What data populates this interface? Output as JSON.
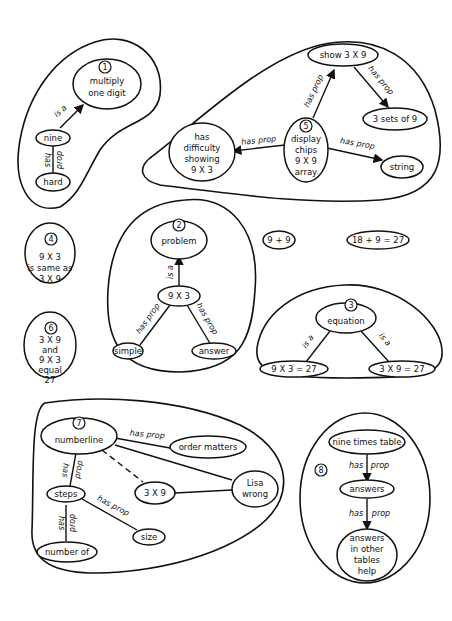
{
  "clusters": {
    "c1": {
      "number": "1",
      "nodes": {
        "root": [
          "multiply",
          "one digit"
        ],
        "nine": "nine",
        "hard": "hard"
      },
      "relations": {
        "nine_root": "is a",
        "nine_hard_a": "has",
        "nine_hard_b": "prop"
      }
    },
    "c2": {
      "number": "2",
      "nodes": {
        "root": "problem",
        "center": "9 X 3",
        "simple": "simple",
        "answer": "answer"
      },
      "relations": {
        "center_root": "is a",
        "center_simple": "has prop",
        "center_answer": "has prop"
      }
    },
    "c3": {
      "number": "3",
      "nodes": {
        "root": "equation",
        "left": "9 X 3 = 27",
        "right": "3 X 9 = 27"
      },
      "relations": {
        "root_left": "is a",
        "root_right": "is a"
      }
    },
    "c4": {
      "number": "4",
      "lines": [
        "9 X 3",
        "is same as",
        "3 X 9"
      ]
    },
    "c5": {
      "number": "5",
      "nodes": {
        "center": [
          "display",
          "chips",
          "9 X 9",
          "array"
        ],
        "show": "show 3 X 9",
        "sets": "3 sets of 9",
        "difficulty": [
          "has",
          "difficulty",
          "showing",
          "9 X 3"
        ],
        "string": "string"
      },
      "relations": {
        "center_show": "has prop",
        "show_sets": "has prop",
        "center_difficulty": "has prop",
        "center_string": "has prop"
      }
    },
    "c6": {
      "number": "6",
      "lines": [
        "3 X 9",
        "and",
        "9 X 3",
        "equal",
        "27"
      ]
    },
    "c7": {
      "number": "7",
      "nodes": {
        "root": "numberline",
        "order": "order matters",
        "lisa": [
          "Lisa",
          "wrong"
        ],
        "three_by_nine": "3 X 9",
        "steps": "steps",
        "size": "size",
        "number_of": "number of"
      },
      "relations": {
        "root_order": "has prop",
        "root_steps_a": "has",
        "root_steps_b": "prop",
        "steps_size": "has prop",
        "steps_number_a": "has",
        "steps_number_b": "prop"
      }
    },
    "c8": {
      "number": "8",
      "nodes": {
        "root": "nine times table",
        "answers": "answers",
        "help": [
          "answers",
          "in other",
          "tables",
          "help"
        ]
      },
      "relations": {
        "root_answers_a": "has",
        "root_answers_b": "prop",
        "answers_help_a": "has",
        "answers_help_b": "prop"
      }
    }
  },
  "standalone": {
    "nine_plus_nine": "9 + 9",
    "eighteen_plus_nine": "18 + 9 = 27"
  }
}
